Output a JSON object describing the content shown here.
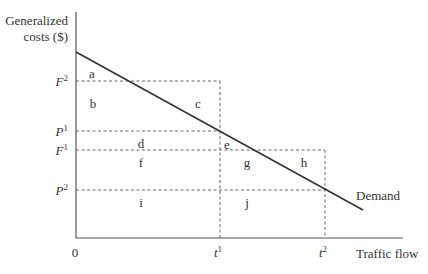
{
  "diagram": {
    "type": "economics-demand-diagram",
    "y_axis_label_line1": "Generalized",
    "y_axis_label_line2": "costs ($)",
    "x_axis_label": "Traffic flow",
    "origin_label": "0",
    "curve_label": "Demand",
    "y_ticks": {
      "F2": {
        "base": "F",
        "sup": "2"
      },
      "P1": {
        "base": "P",
        "sup": "1"
      },
      "F1": {
        "base": "F",
        "sup": "1"
      },
      "P2": {
        "base": "P",
        "sup": "2"
      }
    },
    "x_ticks": {
      "t1": {
        "base": "t",
        "sup": "1"
      },
      "t2": {
        "base": "t",
        "sup": "2"
      }
    },
    "areas": {
      "a": "a",
      "b": "b",
      "c": "c",
      "d": "d",
      "e": "e",
      "f": "f",
      "g": "g",
      "h": "h",
      "i": "i",
      "j": "j"
    },
    "colors": {
      "line": "#333333",
      "axis": "#555555",
      "text": "#333333"
    }
  }
}
